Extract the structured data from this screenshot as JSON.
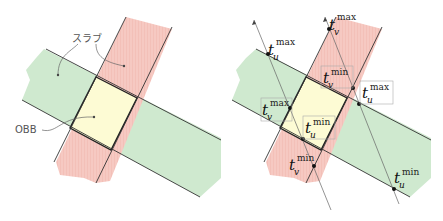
{
  "left_diagram": {
    "labels": {
      "slab": "スラブ",
      "obb": "OBB"
    }
  },
  "right_diagram": {
    "labels": [
      {
        "base": "t",
        "sub": "u",
        "sup": "max",
        "id": "tu-max-left"
      },
      {
        "base": "t",
        "sub": "v",
        "sup": "max",
        "id": "tv-max-top"
      },
      {
        "base": "t",
        "sub": "v",
        "sup": "min",
        "id": "tv-min-top"
      },
      {
        "base": "t",
        "sub": "u",
        "sup": "max",
        "id": "tu-max-right"
      },
      {
        "base": "t",
        "sub": "v",
        "sup": "max",
        "id": "tv-max-left"
      },
      {
        "base": "t",
        "sub": "u",
        "sup": "min",
        "id": "tu-min-center"
      },
      {
        "base": "t",
        "sub": "v",
        "sup": "min",
        "id": "tv-min-bottom"
      },
      {
        "base": "t",
        "sub": "u",
        "sup": "min",
        "id": "tu-min-right"
      }
    ]
  },
  "colors": {
    "green_slab": "#cfe9cf",
    "red_slab": "#f6c9c2",
    "obb_fill": "#fdfbd4",
    "line": "#333333"
  }
}
